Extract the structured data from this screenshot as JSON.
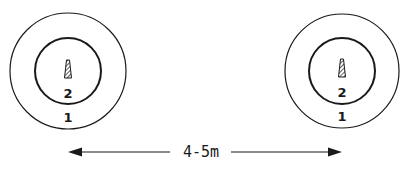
{
  "diagram": {
    "stations": [
      {
        "id": "left",
        "outer_zone_label": "1",
        "inner_zone_label": "2",
        "icon": "nozzle-icon"
      },
      {
        "id": "right",
        "outer_zone_label": "1",
        "inner_zone_label": "2",
        "icon": "nozzle-icon"
      }
    ],
    "dimension": {
      "label": "4-5m",
      "style": "double-arrow"
    },
    "colors": {
      "line": "#1a1a1a",
      "background": "#ffffff"
    }
  }
}
